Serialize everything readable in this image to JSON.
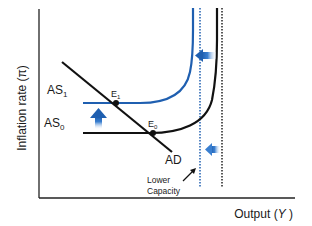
{
  "diagram": {
    "axes": {
      "y_label": "Inflation rate (π)",
      "x_label": "Output (",
      "x_label_var": "Y",
      "x_label_close": " )"
    },
    "curves": {
      "as1": {
        "label": "AS",
        "sub": "1",
        "color": "#1f5fb0"
      },
      "as0": {
        "label": "AS",
        "sub": "0",
        "color": "#111111"
      },
      "ad": {
        "label": "AD",
        "color": "#111111"
      }
    },
    "points": {
      "e1": {
        "label": "E",
        "sub": "1"
      },
      "e0": {
        "label": "E",
        "sub": "0"
      }
    },
    "annotation": {
      "line1": "Lower",
      "line2": "Capacity"
    },
    "colors": {
      "blue": "#1f5fb0",
      "black": "#111111",
      "arrow_blue": "#3a7fd0"
    }
  }
}
